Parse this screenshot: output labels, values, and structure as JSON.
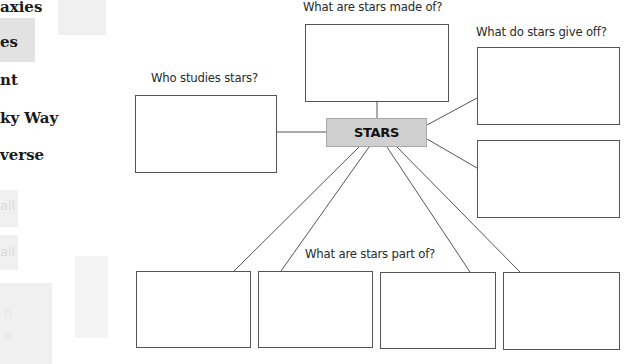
{
  "sidebar": {
    "items": [
      {
        "label": "axies",
        "top": 3
      },
      {
        "label": "es",
        "top": 36
      },
      {
        "label": "nt",
        "top": 72
      },
      {
        "label": "ky Way",
        "top": 110
      },
      {
        "label": "verse",
        "top": 147
      }
    ],
    "ghost_items": [
      {
        "label": "ail"
      },
      {
        "label": "ail"
      },
      {
        "label": "n"
      },
      {
        "label": "a"
      }
    ]
  },
  "diagram": {
    "center": {
      "label": "STARS",
      "fill": "#cfcfcf"
    },
    "questions": {
      "made_of": "What are stars made of?",
      "give_off": "What do stars give off?",
      "who_studies": "Who studies stars?",
      "part_of": "What are stars part of?"
    },
    "answer_boxes": {
      "made_of": "",
      "give_off_1": "",
      "give_off_2": "",
      "who_studies": "",
      "part_of_1": "",
      "part_of_2": "",
      "part_of_3": "",
      "part_of_4": ""
    }
  }
}
